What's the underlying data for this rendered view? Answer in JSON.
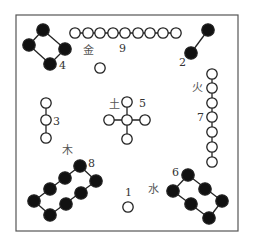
{
  "colors": {
    "yin_dot": "#111111",
    "yang_dot": "#ffffff",
    "stroke": "#222222",
    "frame": "#555555"
  },
  "frame": {
    "x": 16,
    "y": 15,
    "w": 222,
    "h": 216
  },
  "groups": [
    {
      "number": "1",
      "type": "yang",
      "label": {
        "x": 125,
        "y": 196
      },
      "dots": [
        [
          128,
          207
        ]
      ],
      "lines": []
    },
    {
      "number": "2",
      "type": "yin",
      "label": {
        "x": 179,
        "y": 66
      },
      "dots": [
        [
          208,
          30
        ],
        [
          191,
          53
        ]
      ],
      "lines": [
        [
          [
            208,
            30
          ],
          [
            191,
            53
          ]
        ]
      ]
    },
    {
      "number": "3",
      "type": "yang",
      "label": {
        "x": 53,
        "y": 125
      },
      "dots": [
        [
          46,
          103
        ],
        [
          46,
          120
        ],
        [
          46,
          138
        ]
      ],
      "lines": [
        [
          [
            46,
            103
          ],
          [
            46,
            138
          ]
        ]
      ]
    },
    {
      "number": "4",
      "type": "yin",
      "label": {
        "x": 59,
        "y": 69
      },
      "dots": [
        [
          43,
          30
        ],
        [
          29,
          45
        ],
        [
          65,
          49
        ],
        [
          50,
          64
        ]
      ],
      "lines": [
        [
          [
            43,
            30
          ],
          [
            29,
            45
          ]
        ],
        [
          [
            29,
            45
          ],
          [
            50,
            64
          ]
        ],
        [
          [
            50,
            64
          ],
          [
            65,
            49
          ]
        ],
        [
          [
            65,
            49
          ],
          [
            43,
            30
          ]
        ]
      ]
    },
    {
      "number": "5",
      "type": "yang",
      "label": {
        "x": 139,
        "y": 107
      },
      "dots": [
        [
          127,
          120
        ],
        [
          127,
          102
        ],
        [
          109,
          120
        ],
        [
          145,
          120
        ],
        [
          127,
          139
        ]
      ],
      "lines": [
        [
          [
            127,
            102
          ],
          [
            127,
            139
          ]
        ],
        [
          [
            109,
            120
          ],
          [
            145,
            120
          ]
        ]
      ]
    },
    {
      "number": "6",
      "type": "yin",
      "label": {
        "x": 172,
        "y": 176
      },
      "dots": [
        [
          188,
          175
        ],
        [
          173,
          191
        ],
        [
          205,
          189
        ],
        [
          191,
          204
        ],
        [
          222,
          201
        ],
        [
          209,
          218
        ]
      ],
      "lines": [
        [
          [
            188,
            175
          ],
          [
            173,
            191
          ]
        ],
        [
          [
            188,
            175
          ],
          [
            222,
            201
          ]
        ],
        [
          [
            173,
            191
          ],
          [
            209,
            218
          ]
        ],
        [
          [
            222,
            201
          ],
          [
            209,
            218
          ]
        ]
      ]
    },
    {
      "number": "7",
      "type": "yang",
      "label": {
        "x": 197,
        "y": 121
      },
      "dots": [
        [
          212,
          74
        ],
        [
          212,
          88
        ],
        [
          212,
          103
        ],
        [
          212,
          117
        ],
        [
          212,
          132
        ],
        [
          212,
          147
        ],
        [
          212,
          162
        ]
      ],
      "lines": [
        [
          [
            212,
            74
          ],
          [
            212,
            162
          ]
        ]
      ]
    },
    {
      "number": "8",
      "type": "yin",
      "label": {
        "x": 88,
        "y": 167
      },
      "dots": [
        [
          80,
          166
        ],
        [
          65,
          178
        ],
        [
          50,
          189
        ],
        [
          34,
          201
        ],
        [
          96,
          181
        ],
        [
          81,
          193
        ],
        [
          66,
          204
        ],
        [
          50,
          215
        ]
      ],
      "lines": [
        [
          [
            80,
            166
          ],
          [
            34,
            201
          ]
        ],
        [
          [
            96,
            181
          ],
          [
            50,
            215
          ]
        ],
        [
          [
            80,
            166
          ],
          [
            96,
            181
          ]
        ],
        [
          [
            34,
            201
          ],
          [
            50,
            215
          ]
        ]
      ]
    },
    {
      "number": "9",
      "type": "yang",
      "label": {
        "x": 119,
        "y": 52
      },
      "dots": [
        [
          75,
          33
        ],
        [
          88,
          33
        ],
        [
          100,
          33
        ],
        [
          113,
          33
        ],
        [
          125,
          33
        ],
        [
          138,
          33
        ],
        [
          150,
          33
        ],
        [
          163,
          33
        ],
        [
          176,
          33
        ]
      ],
      "lines": [
        [
          [
            75,
            33
          ],
          [
            176,
            33
          ]
        ]
      ]
    },
    {
      "number": "",
      "type": "yang",
      "label": null,
      "dots": [
        [
          100,
          68
        ]
      ],
      "lines": []
    }
  ],
  "elements": [
    {
      "name": "金",
      "meaning": "metal",
      "x": 83,
      "y": 54
    },
    {
      "name": "火",
      "meaning": "fire",
      "x": 192,
      "y": 91
    },
    {
      "name": "土",
      "meaning": "earth",
      "x": 109,
      "y": 108
    },
    {
      "name": "木",
      "meaning": "wood",
      "x": 62,
      "y": 154
    },
    {
      "name": "水",
      "meaning": "water",
      "x": 148,
      "y": 193
    }
  ]
}
